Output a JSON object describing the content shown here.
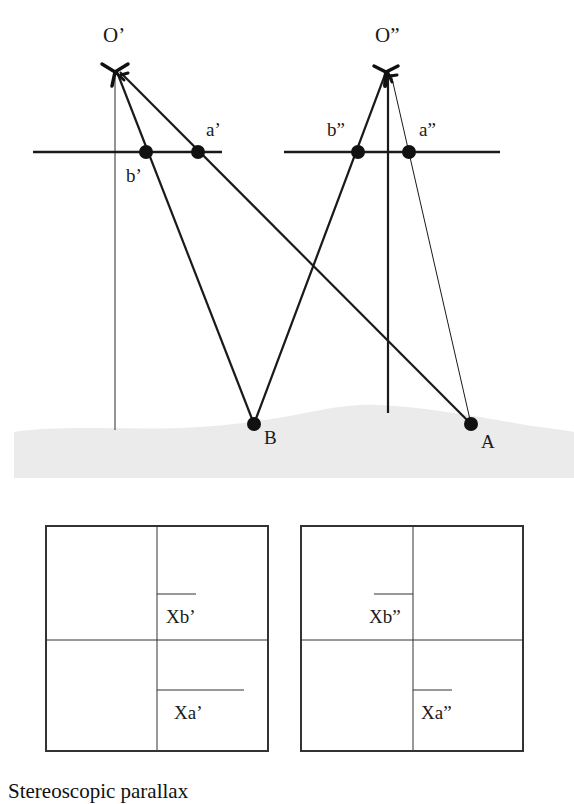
{
  "diagram": {
    "title": "Stereoscopic parallax",
    "exposure_stations": [
      {
        "id": "O1",
        "label": "O’",
        "icon": "airplane-icon"
      },
      {
        "id": "O2",
        "label": "O”",
        "icon": "airplane-icon"
      }
    ],
    "image_points": {
      "left_photo": [
        {
          "label": "a’"
        },
        {
          "label": "b’"
        }
      ],
      "right_photo": [
        {
          "label": "b”"
        },
        {
          "label": "a”"
        }
      ]
    },
    "ground_points": [
      {
        "label": "B"
      },
      {
        "label": "A"
      }
    ],
    "photo_panels": {
      "left": {
        "xb_label": "Xb’",
        "xa_label": "Xa’"
      },
      "right": {
        "xb_label": "Xb”",
        "xa_label": "Xa”"
      }
    },
    "colors": {
      "line": "#1a1a1a",
      "ground": "#ebebeb",
      "background": "#ffffff"
    }
  }
}
